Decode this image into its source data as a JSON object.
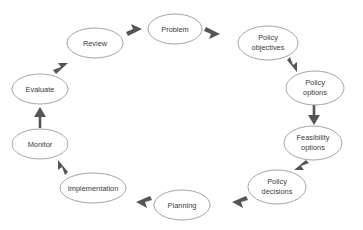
{
  "diagram": {
    "type": "cycle-flow",
    "colors": {
      "background": "#ffffff",
      "node_fill": "#ffffff",
      "node_stroke": "#9a9a9a",
      "label_text": "#3a3a3a",
      "arrow": "#555555"
    },
    "nodes": [
      {
        "id": "problem",
        "label": "Problem",
        "lines": [
          "Problem"
        ],
        "cx": 175,
        "cy": 29,
        "rx": 27,
        "ry": 15
      },
      {
        "id": "policy-objectives",
        "label": "Policy objectives",
        "lines": [
          "Policy",
          "objectives"
        ],
        "cx": 268,
        "cy": 43,
        "rx": 30,
        "ry": 17
      },
      {
        "id": "policy-options",
        "label": "Policy options",
        "lines": [
          "Policy",
          "options"
        ],
        "cx": 315,
        "cy": 88,
        "rx": 29,
        "ry": 17
      },
      {
        "id": "feasibility-options",
        "label": "Feasibility options",
        "lines": [
          "Feasibility",
          "options"
        ],
        "cx": 313,
        "cy": 143,
        "rx": 29,
        "ry": 17
      },
      {
        "id": "policy-decisions",
        "label": "Policy decisions",
        "lines": [
          "Policy",
          "decisions"
        ],
        "cx": 277,
        "cy": 187,
        "rx": 29,
        "ry": 17
      },
      {
        "id": "planning",
        "label": "Planning",
        "lines": [
          "Planning"
        ],
        "cx": 182,
        "cy": 205,
        "rx": 28,
        "ry": 15
      },
      {
        "id": "implementation",
        "label": "Implementation",
        "lines": [
          "Implementation"
        ],
        "cx": 93,
        "cy": 188,
        "rx": 33,
        "ry": 15
      },
      {
        "id": "monitor",
        "label": "Monitor",
        "lines": [
          "Monitor"
        ],
        "cx": 40,
        "cy": 144,
        "rx": 28,
        "ry": 15
      },
      {
        "id": "evaluate",
        "label": "Evaluate",
        "lines": [
          "Evaluate"
        ],
        "cx": 40,
        "cy": 89,
        "rx": 28,
        "ry": 15
      },
      {
        "id": "review",
        "label": "Review",
        "lines": [
          "Review"
        ],
        "cx": 95,
        "cy": 43,
        "rx": 28,
        "ry": 15
      }
    ],
    "edges": [
      {
        "from": "review",
        "to": "problem",
        "label": ""
      },
      {
        "from": "problem",
        "to": "policy-objectives",
        "label": ""
      },
      {
        "from": "policy-objectives",
        "to": "policy-options",
        "label": ""
      },
      {
        "from": "policy-options",
        "to": "feasibility-options",
        "label": ""
      },
      {
        "from": "feasibility-options",
        "to": "policy-decisions",
        "label": ""
      },
      {
        "from": "policy-decisions",
        "to": "planning",
        "label": ""
      },
      {
        "from": "planning",
        "to": "implementation",
        "label": ""
      },
      {
        "from": "implementation",
        "to": "monitor",
        "label": ""
      },
      {
        "from": "monitor",
        "to": "evaluate",
        "label": ""
      },
      {
        "from": "evaluate",
        "to": "review",
        "label": ""
      }
    ]
  }
}
